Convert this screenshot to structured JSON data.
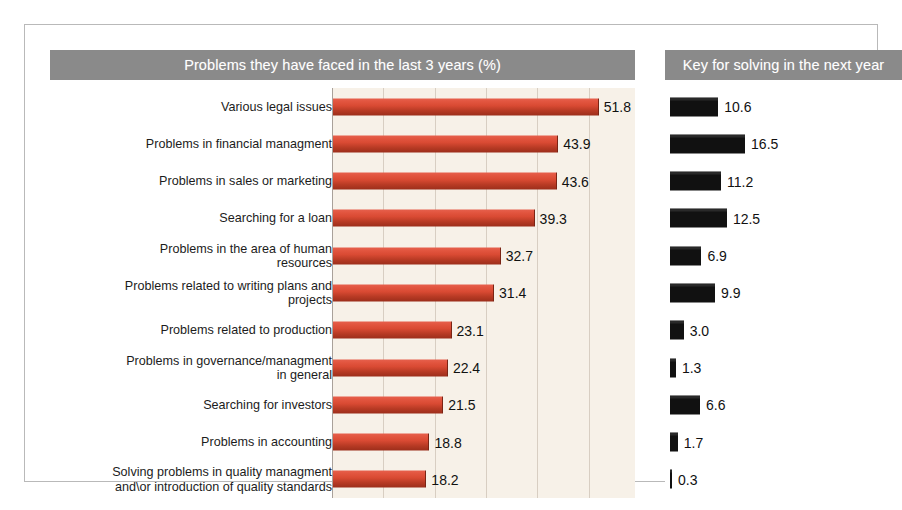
{
  "panels": {
    "left_title": "Problems they have faced in the last 3 years (%)",
    "right_title": "Key for solving in the next year"
  },
  "chart_data": {
    "type": "bar",
    "title": "Problems they have faced in the last 3 years (%)",
    "orientation": "horizontal",
    "xlabel": "",
    "ylabel": "",
    "grid": true,
    "legend": "none",
    "xlim": [
      0,
      60
    ],
    "xticks": [
      0,
      10,
      20,
      30,
      40,
      50
    ],
    "categories": [
      "Various legal issues",
      "Problems in financial managment",
      "Problems in sales or marketing",
      "Searching for a loan",
      "Problems in the area of human resources",
      "Problems related to writing plans and projects",
      "Problems related to production",
      "Problems in governance/managment in general",
      "Searching for investors",
      "Problems in accounting",
      "Solving problems in quality managment and\\or introduction of quality standards"
    ],
    "series": [
      {
        "name": "Problems they have faced in the last 3 years (%)",
        "color": "#d94a33",
        "values": [
          51.8,
          43.9,
          43.6,
          39.3,
          32.7,
          31.4,
          23.1,
          22.4,
          21.5,
          18.8,
          18.2
        ]
      },
      {
        "name": "Key for solving in the next year",
        "color": "#111111",
        "values": [
          10.6,
          16.5,
          11.2,
          12.5,
          6.9,
          9.9,
          3.0,
          1.3,
          6.6,
          1.7,
          0.3
        ]
      }
    ]
  },
  "rows": [
    {
      "label_line1": "Various legal issues",
      "label_line2": "",
      "left_value": "51.8",
      "right_value": "10.6"
    },
    {
      "label_line1": "Problems in financial managment",
      "label_line2": "",
      "left_value": "43.9",
      "right_value": "16.5"
    },
    {
      "label_line1": "Problems in sales or marketing",
      "label_line2": "",
      "left_value": "43.6",
      "right_value": "11.2"
    },
    {
      "label_line1": "Searching for a loan",
      "label_line2": "",
      "left_value": "39.3",
      "right_value": "12.5"
    },
    {
      "label_line1": "Problems in the area of human",
      "label_line2": "resources",
      "left_value": "32.7",
      "right_value": "6.9"
    },
    {
      "label_line1": "Problems related to writing plans and",
      "label_line2": "projects",
      "left_value": "31.4",
      "right_value": "9.9"
    },
    {
      "label_line1": "Problems related to production",
      "label_line2": "",
      "left_value": "23.1",
      "right_value": "3.0"
    },
    {
      "label_line1": "Problems in governance/managment",
      "label_line2": "in general",
      "left_value": "22.4",
      "right_value": "1.3"
    },
    {
      "label_line1": "Searching for investors",
      "label_line2": "",
      "left_value": "21.5",
      "right_value": "6.6"
    },
    {
      "label_line1": "Problems in accounting",
      "label_line2": "",
      "left_value": "18.8",
      "right_value": "1.7"
    },
    {
      "label_line1": "Solving problems in quality managment",
      "label_line2": "and\\or introduction of quality standards",
      "left_value": "18.2",
      "right_value": "0.3"
    }
  ],
  "colors": {
    "header_band": "#8a8a8a",
    "plot_background": "#f7f1e8",
    "left_bar": "#d94a33",
    "right_bar": "#111111",
    "gridline": "#d8cec2"
  }
}
